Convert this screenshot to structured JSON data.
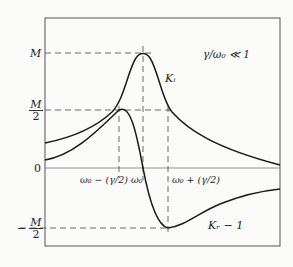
{
  "diagram": {
    "condition": "γ/ω₀ ≪ 1",
    "y_labels": {
      "M": "M",
      "half_num": "M",
      "half_den": "2",
      "zero": "0",
      "neg_sign": "−",
      "neg_num": "M",
      "neg_den": "2"
    },
    "x_labels": {
      "left": "ω₀ − (γ/2)",
      "center": "ω₀",
      "right": "ω₀ + (γ/2)"
    },
    "curves": {
      "absorptive": "Kᵢ",
      "dispersive": "Kᵣ − 1"
    },
    "colors": {
      "line": "#1a1a1a",
      "frame": "#555555",
      "dash": "#444444",
      "background": "#fbfbfa"
    }
  }
}
